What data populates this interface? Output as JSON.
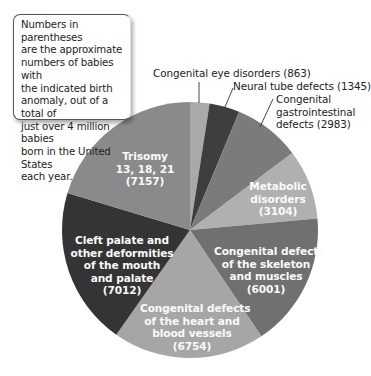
{
  "note": "Numbers in parentheses are the approximate numbers of babies with the indicated birth anomaly, out of a total of just over 4 million babies born in the United States each year.",
  "chart_data": {
    "type": "pie",
    "title": "",
    "total": 35219,
    "start_angle_deg": 0,
    "direction": "clockwise",
    "slices": [
      {
        "label": "Congenital eye disorders",
        "value": 863,
        "color": "#a9a9a9",
        "label_position": "outside"
      },
      {
        "label": "Neural tube defects",
        "value": 1345,
        "color": "#3e3e3e",
        "label_position": "outside"
      },
      {
        "label": "Congenital gastrointestinal defects",
        "value": 2983,
        "color": "#7b7b7b",
        "label_position": "outside"
      },
      {
        "label": "Metabolic disorders",
        "value": 3104,
        "color": "#b0b0b0",
        "label_position": "inside"
      },
      {
        "label": "Congenital defects of the skeleton and muscles",
        "value": 6001,
        "color": "#707070",
        "label_position": "inside"
      },
      {
        "label": "Congenital defects of the heart and blood vessels",
        "value": 6754,
        "color": "#a6a6a6",
        "label_position": "inside"
      },
      {
        "label": "Cleft palate and other deformities of the mouth and palate",
        "value": 7012,
        "color": "#343434",
        "label_position": "inside"
      },
      {
        "label": "Trisomy 13, 18, 21",
        "value": 7157,
        "color": "#8a8a8a",
        "label_position": "inside"
      }
    ]
  },
  "labels": {
    "eye": "Congenital eye disorders (863)",
    "neural": "Neural tube defects (1345)",
    "gi_1": "Congenital",
    "gi_2": "gastrointestinal",
    "gi_3": "defects (2983)",
    "metabolic_1": "Metabolic",
    "metabolic_2": "disorders",
    "metabolic_3": "(3104)",
    "skeleton_1": "Congenital defects",
    "skeleton_2": "of the skeleton",
    "skeleton_3": "and muscles",
    "skeleton_4": "(6001)",
    "heart_1": "Congenital defects",
    "heart_2": "of the heart and",
    "heart_3": "blood vessels",
    "heart_4": "(6754)",
    "cleft_1": "Cleft palate and",
    "cleft_2": "other deformities",
    "cleft_3": "of the mouth",
    "cleft_4": "and palate",
    "cleft_5": "(7012)",
    "trisomy_1": "Trisomy",
    "trisomy_2": "13, 18, 21",
    "trisomy_3": "(7157)"
  },
  "callout": {
    "line1": "Numbers in parentheses",
    "line2": "are the approximate",
    "line3": "numbers of babies with",
    "line4": "the indicated birth",
    "line5": "anomaly, out of a total of",
    "line6": "just over 4 million babies",
    "line7": "born in the United States",
    "line8": "each year."
  }
}
